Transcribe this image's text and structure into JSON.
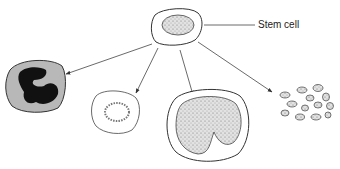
{
  "diagram": {
    "labels": {
      "stem_cell": "Stem cell"
    },
    "nodes": [
      {
        "id": "stem-cell",
        "label": "Stem cell"
      },
      {
        "id": "granulocyte",
        "label": ""
      },
      {
        "id": "small-cell",
        "label": ""
      },
      {
        "id": "large-cell",
        "label": ""
      },
      {
        "id": "platelets",
        "label": ""
      }
    ],
    "edges": [
      {
        "from": "stem-cell",
        "to": "granulocyte"
      },
      {
        "from": "stem-cell",
        "to": "small-cell"
      },
      {
        "from": "stem-cell",
        "to": "large-cell"
      },
      {
        "from": "stem-cell",
        "to": "platelets"
      }
    ],
    "colors": {
      "stroke": "#333333",
      "granulocyte_fill": "#b8b8b8",
      "nucleus_dark": "#111111",
      "stipple": "#d6d6d6"
    }
  }
}
